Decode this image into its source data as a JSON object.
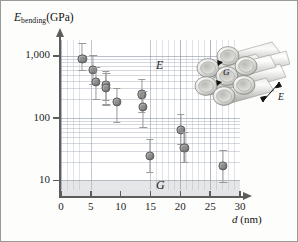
{
  "figure": {
    "y_axis_title_main": "E",
    "y_axis_title_sub": "bending",
    "y_axis_title_unit": "(GPa)",
    "x_axis_title_var": "d",
    "x_axis_title_unit": "(nm)",
    "y_ticks": [
      "1,000",
      "100",
      "10"
    ],
    "x_ticks": [
      "0",
      "5",
      "10",
      "15",
      "20",
      "25",
      "30"
    ],
    "annotation_E": "E",
    "annotation_G": "G",
    "inset_label_G": "G",
    "inset_label_E": "E",
    "colors": {
      "marker_fill": "#8d8d8d",
      "marker_edge": "#5a5a5a",
      "errorbar": "#9a9a9a",
      "axis": "#5c5c5c",
      "grid_minor": "#96a0af",
      "band_G": "#afb2b6",
      "background": "#ffffff"
    }
  },
  "chart_data": {
    "type": "scatter",
    "title": "",
    "xlabel": "d (nm)",
    "ylabel": "E_bending (GPa)",
    "xlim": [
      0,
      30
    ],
    "ylim": [
      7,
      1800
    ],
    "yscale": "log",
    "xscale": "linear",
    "grid": true,
    "legend": "none",
    "annotations": [
      {
        "text": "E",
        "x": 16.6,
        "y": 700,
        "note": "axial Young's modulus regime label"
      },
      {
        "text": "G",
        "x": 16.6,
        "y": 8.3,
        "note": "shear modulus regime label, inside shaded band"
      }
    ],
    "shaded_region": {
      "ymin": 7,
      "ymax": 10,
      "label": "G",
      "note": "grey band below 10 GPa"
    },
    "x": [
      3.5,
      5.3,
      5.8,
      7.4,
      7.5,
      9.3,
      13.5,
      13.7,
      14.8,
      20.0,
      20.6,
      27.1
    ],
    "y": [
      900,
      600,
      380,
      340,
      310,
      180,
      240,
      150,
      25,
      65,
      33,
      17
    ],
    "yerr_low": [
      330,
      260,
      185,
      150,
      150,
      95,
      120,
      80,
      12,
      28,
      14,
      8
    ],
    "yerr_high": [
      700,
      420,
      280,
      230,
      230,
      130,
      190,
      120,
      22,
      50,
      26,
      14
    ],
    "points": [
      {
        "d": 3.5,
        "E": 900,
        "E_low": 570,
        "E_high": 1600
      },
      {
        "d": 5.3,
        "E": 600,
        "E_low": 340,
        "E_high": 1020
      },
      {
        "d": 5.8,
        "E": 380,
        "E_low": 195,
        "E_high": 660
      },
      {
        "d": 7.4,
        "E": 340,
        "E_low": 190,
        "E_high": 570
      },
      {
        "d": 7.5,
        "E": 310,
        "E_low": 160,
        "E_high": 540
      },
      {
        "d": 9.3,
        "E": 180,
        "E_low": 85,
        "E_high": 310
      },
      {
        "d": 13.5,
        "E": 240,
        "E_low": 120,
        "E_high": 430
      },
      {
        "d": 13.7,
        "E": 150,
        "E_low": 70,
        "E_high": 270
      },
      {
        "d": 14.8,
        "E": 25,
        "E_low": 13,
        "E_high": 47
      },
      {
        "d": 20.0,
        "E": 65,
        "E_low": 37,
        "E_high": 115
      },
      {
        "d": 20.6,
        "E": 33,
        "E_low": 19,
        "E_high": 59
      },
      {
        "d": 27.1,
        "E": 17,
        "E_low": 9,
        "E_high": 31
      }
    ]
  }
}
